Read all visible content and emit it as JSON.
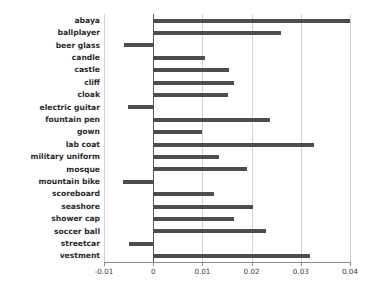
{
  "chart_data": {
    "type": "bar",
    "orientation": "horizontal",
    "title": "",
    "subtitle": "",
    "xlabel": "",
    "ylabel": "",
    "xlim": [
      -0.01,
      0.04
    ],
    "ylim": null,
    "grid": true,
    "legend": null,
    "xticks": [
      -0.01,
      0,
      0.01,
      0.02,
      0.03,
      0.04
    ],
    "xticklabels": [
      "-0.01",
      "0",
      "0.01",
      "0.02",
      "0.03",
      "0.04"
    ],
    "categories": [
      "abaya",
      "ballplayer",
      "beer glass",
      "candle",
      "castle",
      "cliff",
      "cloak",
      "electric guitar",
      "fountain pen",
      "gown",
      "lab coat",
      "military uniform",
      "mosque",
      "mountain bike",
      "scoreboard",
      "seashore",
      "shower cap",
      "soccer ball",
      "streetcar",
      "vestment"
    ],
    "values": [
      0.04,
      0.026,
      -0.006,
      0.0105,
      0.0155,
      0.0165,
      0.0152,
      -0.0051,
      0.0238,
      0.01,
      0.0327,
      0.0134,
      0.019,
      -0.0062,
      0.0124,
      0.0202,
      0.0165,
      0.023,
      -0.005,
      0.0318
    ],
    "bar_color": "#4d4d4d",
    "grid_color": "#d2d2d2",
    "axis_color": "#8c8c8c"
  }
}
